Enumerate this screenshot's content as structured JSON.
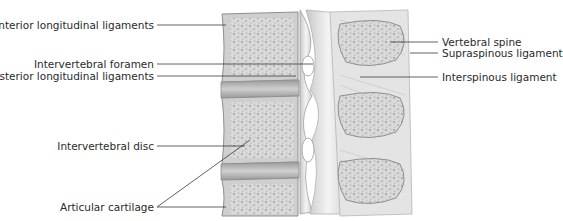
{
  "diagram": {
    "colors": {
      "background": "#ffffff",
      "bone": "#d4d4d4",
      "bone_dark": "#a8a8a8",
      "ligament": "#e6e6e6",
      "leader_line": "#3a3a3a",
      "text": "#2a2a2a"
    },
    "labels_left": [
      {
        "id": "anterior-longitudinal-ligaments",
        "text": "Anterior longitudinal ligaments"
      },
      {
        "id": "intervertebral-foramen",
        "text": "Intervertebral foramen"
      },
      {
        "id": "posterior-longitudinal-ligaments",
        "text": "Posterior longitudinal ligaments"
      },
      {
        "id": "intervertebral-disc",
        "text": "Intervertebral disc"
      },
      {
        "id": "articular-cartilage",
        "text": "Articular cartilage"
      }
    ],
    "labels_right": [
      {
        "id": "vertebral-spine",
        "text": "Vertebral spine"
      },
      {
        "id": "supraspinous-ligament",
        "text": "Supraspinous ligament"
      },
      {
        "id": "interspinous-ligament",
        "text": "Interspinous ligament"
      }
    ]
  }
}
